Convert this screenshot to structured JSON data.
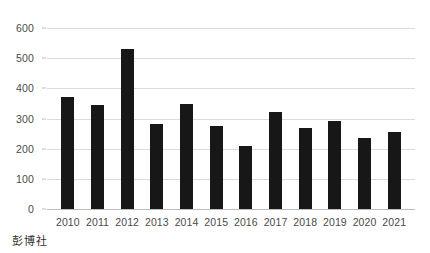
{
  "chart_data": {
    "type": "bar",
    "title": "",
    "subtitle": "",
    "xlabel": "",
    "ylabel": "",
    "categories": [
      "2010",
      "2011",
      "2012",
      "2013",
      "2014",
      "2015",
      "2016",
      "2017",
      "2018",
      "2019",
      "2020",
      "2021"
    ],
    "values": [
      372,
      345,
      530,
      282,
      348,
      275,
      209,
      322,
      270,
      292,
      234,
      254
    ],
    "ylim": [
      0,
      600
    ],
    "y_ticks": [
      0,
      100,
      200,
      300,
      400,
      500,
      600
    ],
    "y_tick_labels": [
      "0",
      "100",
      "200",
      "300",
      "400",
      "500",
      "600"
    ],
    "grid": true,
    "legend": null,
    "legend_position": "none",
    "bar_color": "#171717",
    "gridline_color": "#dcdcdc",
    "axis_color": "#bdbdbd",
    "text_color": "#4a4a4a"
  },
  "source": {
    "label": "彭博社"
  }
}
